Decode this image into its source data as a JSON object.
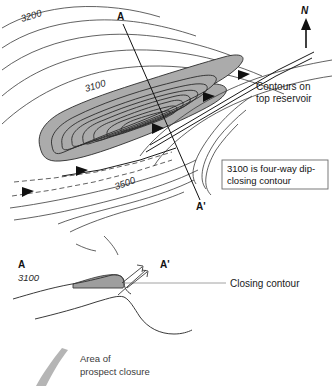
{
  "figure": {
    "background_color": "#ffffff",
    "line_color": "#2b2b2b",
    "closure_fill_color": "#ababab"
  },
  "map": {
    "north_arrow": {
      "label": "N",
      "name": "north-arrow"
    },
    "section_line": {
      "start_label": "A",
      "end_label": "A'"
    },
    "contour_labels": [
      {
        "value": "3200",
        "name": "contour-label-3200"
      },
      {
        "value": "3100",
        "name": "contour-label-3100"
      },
      {
        "value": "3500",
        "name": "contour-label-3500"
      }
    ],
    "annotations": [
      {
        "name": "contours-on-top-reservoir-note",
        "line1": "Contours on",
        "line2": "top reservoir"
      }
    ],
    "callout_box": {
      "line1": "3100 is four-way dip-",
      "line2": "closing contour"
    }
  },
  "cross_section": {
    "start_label": "A",
    "end_label": "A'",
    "datum_label": "3100",
    "closing_contour_label": "Closing contour"
  },
  "legend": {
    "swatch_name": "closure-area-swatch",
    "line1": "Area of",
    "line2": "prospect closure"
  }
}
